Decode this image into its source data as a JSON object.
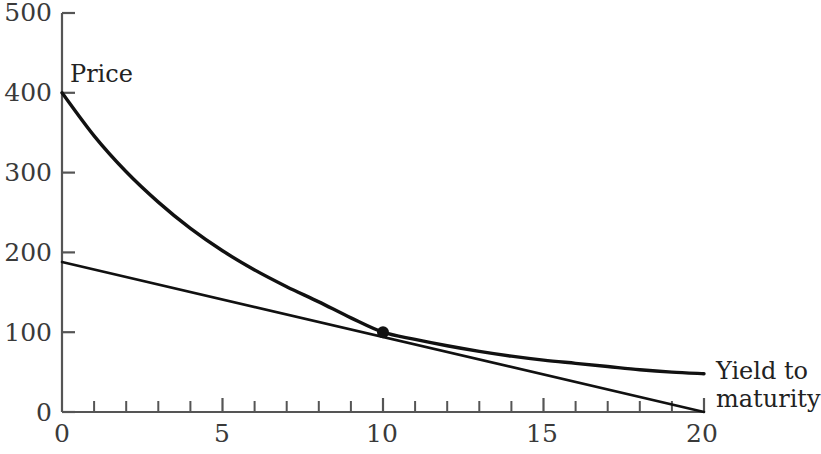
{
  "chart_data": {
    "type": "line",
    "title": "",
    "subtitle": "",
    "xlabel": "Yield to maturity",
    "ylabel": "Price",
    "xlim": [
      0,
      20
    ],
    "ylim": [
      0,
      500
    ],
    "grid": false,
    "legend": null,
    "x_ticks_major": [
      0,
      5,
      10,
      15,
      20
    ],
    "x_ticks_major_labels": [
      "0",
      "5",
      "10",
      "15",
      "20"
    ],
    "x_ticks_minor_step": 1,
    "y_ticks_major": [
      0,
      100,
      200,
      300,
      400,
      500
    ],
    "y_ticks_major_labels": [
      "0",
      "100",
      "200",
      "300",
      "400",
      "500"
    ],
    "series": [
      {
        "name": "price-yield-curve",
        "type": "curve",
        "style": "convex-decreasing",
        "linewidth": 3.4,
        "color": "#111111",
        "points": [
          {
            "x": 0,
            "y": 400
          },
          {
            "x": 1,
            "y": 346
          },
          {
            "x": 2,
            "y": 301
          },
          {
            "x": 3,
            "y": 263
          },
          {
            "x": 4,
            "y": 230
          },
          {
            "x": 5,
            "y": 202
          },
          {
            "x": 6,
            "y": 178
          },
          {
            "x": 7,
            "y": 157
          },
          {
            "x": 8,
            "y": 138
          },
          {
            "x": 9,
            "y": 118
          },
          {
            "x": 10,
            "y": 100
          },
          {
            "x": 11,
            "y": 91
          },
          {
            "x": 12,
            "y": 83
          },
          {
            "x": 13,
            "y": 76
          },
          {
            "x": 14,
            "y": 70
          },
          {
            "x": 15,
            "y": 65
          },
          {
            "x": 16,
            "y": 61
          },
          {
            "x": 17,
            "y": 57
          },
          {
            "x": 18,
            "y": 53
          },
          {
            "x": 19,
            "y": 50
          },
          {
            "x": 20,
            "y": 48
          }
        ]
      },
      {
        "name": "tangent-line",
        "type": "line",
        "style": "straight",
        "linewidth": 2.6,
        "color": "#111111",
        "points": [
          {
            "x": 0,
            "y": 188
          },
          {
            "x": 20,
            "y": 0
          }
        ]
      }
    ],
    "annotations": [
      {
        "name": "tangency-point",
        "type": "point-marker",
        "x": 10,
        "y": 100,
        "radius": 6,
        "color": "#111111"
      }
    ]
  },
  "labels": {
    "price_label": "Price",
    "yield_label_line1": "Yield to",
    "yield_label_line2": "maturity"
  },
  "y_axis": {
    "values": [
      "500",
      "400",
      "300",
      "200",
      "100",
      "0"
    ]
  },
  "x_axis": {
    "values": [
      "0",
      "5",
      "10",
      "15",
      "20"
    ]
  },
  "colors": {
    "background": "#ffffff",
    "axis": "#555555",
    "curve": "#111111",
    "tick_text": "#3a3a3a",
    "annotation_text": "#222222"
  }
}
